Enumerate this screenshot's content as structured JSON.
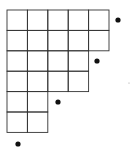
{
  "diagram": {
    "type": "young-diagram",
    "origin": {
      "x": 7,
      "y": 10
    },
    "cell_size": 20.4,
    "row_lengths": [
      5,
      5,
      4,
      4,
      2,
      2
    ],
    "line_color": "#333333",
    "dot_color": "#111111",
    "dots": [
      {
        "x": 118,
        "y": 20,
        "r": 2.6
      },
      {
        "x": 97,
        "y": 61,
        "r": 2.6
      },
      {
        "x": 58,
        "y": 102,
        "r": 2.6
      },
      {
        "x": 18,
        "y": 144,
        "r": 2.6
      }
    ],
    "specks": [
      {
        "x": 129,
        "y": 83,
        "r": 0.6
      }
    ]
  }
}
